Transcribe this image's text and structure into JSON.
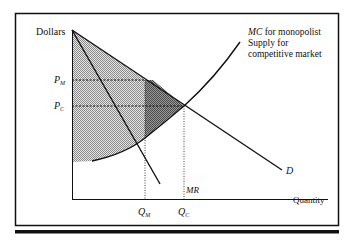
{
  "diagram": {
    "y_axis_label": "Dollars",
    "x_axis_label": "Quantity",
    "price_labels": {
      "pm": "P",
      "pm_sub": "M",
      "pc": "P",
      "pc_sub": "C"
    },
    "quantity_labels": {
      "qm": "Q",
      "qm_sub": "M",
      "qc": "Q",
      "qc_sub": "C"
    },
    "curves": {
      "demand": "D",
      "marginal_revenue": "MR",
      "mc_label_italic": "MC",
      "mc_label_rest": " for monopolist",
      "supply_line1": "Supply for",
      "supply_line2": "competitive market"
    },
    "colors": {
      "line": "#111111",
      "light_shade": "#bdbdbd",
      "dark_shade": "#7a7a7a",
      "background": "#ffffff"
    }
  }
}
